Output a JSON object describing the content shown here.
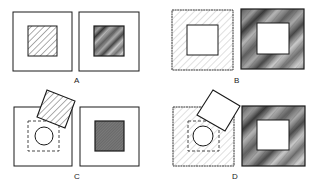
{
  "figure": {
    "panels": [
      {
        "id": "A",
        "label": "A",
        "label_x": 74,
        "label_y": 76,
        "left": {
          "outer": [
            13,
            12,
            59,
            59
          ],
          "inner": [
            28,
            26,
            29,
            30
          ],
          "fill": "light-hatch",
          "inner_fill": "hatched"
        },
        "right": {
          "outer": [
            79,
            12,
            60,
            59
          ],
          "inner": [
            94,
            26,
            30,
            30
          ],
          "inner_fill": "dark-streaked"
        }
      },
      {
        "id": "B",
        "label": "B",
        "label_x": 234,
        "label_y": 76,
        "left": {
          "outer": [
            172,
            10,
            61,
            60
          ],
          "inner": [
            187,
            25,
            31,
            30
          ],
          "fill": "light-hatch",
          "inner_fill": "white"
        },
        "right": {
          "outer": [
            241,
            9,
            63,
            60
          ],
          "inner": [
            257,
            23,
            32,
            31
          ],
          "fill": "dark-streaked",
          "inner_fill": "white"
        }
      },
      {
        "id": "C",
        "label": "C",
        "label_x": 74,
        "label_y": 172,
        "left": {
          "outer": [
            14,
            107,
            58,
            59
          ],
          "dashed_inner": [
            28,
            121,
            31,
            30
          ],
          "circle": [
            44,
            136,
            9
          ],
          "rotated_square": "47,90 75,101 65,128 37,117",
          "rotated_fill": "hatched"
        },
        "right": {
          "outer": [
            80,
            107,
            59,
            59
          ],
          "inner": [
            95,
            121,
            29,
            30
          ],
          "inner_fill": "dark-fine-hatch"
        }
      },
      {
        "id": "D",
        "label": "D",
        "label_x": 232,
        "label_y": 172,
        "left": {
          "outer": [
            173,
            107,
            61,
            59
          ],
          "fill": "light-hatch",
          "dashed_inner": [
            188,
            121,
            31,
            30
          ],
          "circle": [
            203,
            136,
            10
          ],
          "rotated_square": "213,90 240,106 225,131 197,115",
          "rotated_fill": "white"
        },
        "right": {
          "outer": [
            242,
            106,
            63,
            60
          ],
          "inner": [
            257,
            120,
            32,
            30
          ],
          "fill": "dark-streaked",
          "inner_fill": "white"
        }
      }
    ]
  },
  "labels": {
    "A": "A",
    "B": "B",
    "C": "C",
    "D": "D"
  },
  "colors": {
    "stroke": "#1a1a1a",
    "hatch_light": "#9a9a9a",
    "dark_fill": "#6a6a6a",
    "white": "#ffffff"
  }
}
